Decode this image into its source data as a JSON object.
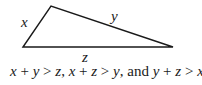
{
  "diagram": {
    "type": "triangle",
    "vertices": {
      "bottom_left": [
        23,
        47
      ],
      "top": [
        51,
        6
      ],
      "bottom_right": [
        173,
        47
      ]
    },
    "stroke_color": "#1a1a1a",
    "side_labels": {
      "left": "x",
      "top": "y",
      "bottom": "z"
    }
  },
  "caption": {
    "parts": [
      {
        "text": "x",
        "italic": true
      },
      {
        "text": " + ",
        "italic": false
      },
      {
        "text": "y",
        "italic": true
      },
      {
        "text": " > ",
        "italic": false
      },
      {
        "text": "z",
        "italic": true
      },
      {
        "text": ", ",
        "italic": false
      },
      {
        "text": "x",
        "italic": true
      },
      {
        "text": " + ",
        "italic": false
      },
      {
        "text": "z",
        "italic": true
      },
      {
        "text": " > ",
        "italic": false
      },
      {
        "text": "y",
        "italic": true
      },
      {
        "text": ", and ",
        "italic": false
      },
      {
        "text": "y",
        "italic": true
      },
      {
        "text": " + ",
        "italic": false
      },
      {
        "text": "z",
        "italic": true
      },
      {
        "text": " > ",
        "italic": false
      },
      {
        "text": "x",
        "italic": true
      }
    ],
    "full_text": "x + y > z, x + z > y, and y + z > x"
  }
}
